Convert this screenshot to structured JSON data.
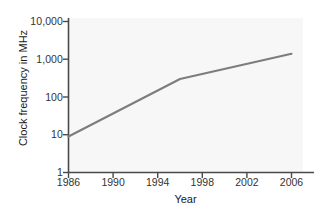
{
  "chart_data": {
    "type": "line",
    "title": "",
    "xlabel": "Year",
    "ylabel": "Clock frequency in MHz",
    "yscale": "log",
    "xlim": [
      1986,
      2008
    ],
    "ylim": [
      1,
      10000
    ],
    "grid": false,
    "legend": null,
    "x_ticks": [
      "1986",
      "1990",
      "1994",
      "1998",
      "2002",
      "2006"
    ],
    "x_tick_values": [
      1986,
      1990,
      1994,
      1998,
      2002,
      2006
    ],
    "y_ticks": [
      "1",
      "10",
      "100",
      "1,000",
      "10,000"
    ],
    "y_tick_values": [
      1,
      10,
      100,
      1000,
      10000
    ],
    "series": [
      {
        "name": "Clock frequency",
        "color": "#7d7d7d",
        "x": [
          1986,
          1996,
          2006
        ],
        "values": [
          9,
          300,
          1400
        ]
      }
    ]
  },
  "axes": {
    "x_title": "Year",
    "y_title": "Clock frequency in MHz",
    "axis_color": "#4a4a4a",
    "plot_background": "#f7f7f7"
  }
}
